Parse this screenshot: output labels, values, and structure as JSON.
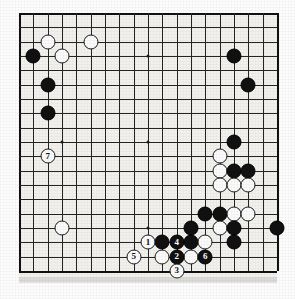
{
  "board": {
    "type": "go-board",
    "size": 19,
    "origin_x": 19,
    "origin_y": 13,
    "spacing": 14.33,
    "star_points": [
      [
        3,
        3
      ],
      [
        9,
        3
      ],
      [
        15,
        3
      ],
      [
        3,
        9
      ],
      [
        9,
        9
      ],
      [
        15,
        9
      ],
      [
        3,
        15
      ],
      [
        9,
        15
      ],
      [
        15,
        15
      ]
    ],
    "background_color": "#f2f1ed",
    "line_color": "#242424",
    "black_color": "#111111",
    "white_color": "#fbfbfb"
  },
  "stones": [
    {
      "color": "white",
      "col": 2,
      "row": 2,
      "label": ""
    },
    {
      "color": "white",
      "col": 5,
      "row": 2,
      "label": ""
    },
    {
      "color": "white",
      "col": 3,
      "row": 3,
      "label": ""
    },
    {
      "color": "black",
      "col": 1,
      "row": 3,
      "label": ""
    },
    {
      "color": "black",
      "col": 15,
      "row": 3,
      "label": ""
    },
    {
      "color": "black",
      "col": 2,
      "row": 5,
      "label": ""
    },
    {
      "color": "black",
      "col": 16,
      "row": 5,
      "label": ""
    },
    {
      "color": "black",
      "col": 2,
      "row": 7,
      "label": ""
    },
    {
      "color": "black",
      "col": 15,
      "row": 9,
      "label": ""
    },
    {
      "color": "white",
      "col": 2,
      "row": 10,
      "label": "7"
    },
    {
      "color": "white",
      "col": 14,
      "row": 10,
      "label": ""
    },
    {
      "color": "white",
      "col": 14,
      "row": 11,
      "label": ""
    },
    {
      "color": "black",
      "col": 15,
      "row": 11,
      "label": ""
    },
    {
      "color": "black",
      "col": 16,
      "row": 11,
      "label": ""
    },
    {
      "color": "white",
      "col": 14,
      "row": 12,
      "label": ""
    },
    {
      "color": "white",
      "col": 15,
      "row": 12,
      "label": ""
    },
    {
      "color": "white",
      "col": 16,
      "row": 12,
      "label": ""
    },
    {
      "color": "black",
      "col": 13,
      "row": 14,
      "label": ""
    },
    {
      "color": "black",
      "col": 14,
      "row": 14,
      "label": ""
    },
    {
      "color": "white",
      "col": 15,
      "row": 14,
      "label": ""
    },
    {
      "color": "white",
      "col": 16,
      "row": 14,
      "label": ""
    },
    {
      "color": "white",
      "col": 3,
      "row": 15,
      "label": ""
    },
    {
      "color": "black",
      "col": 12,
      "row": 15,
      "label": ""
    },
    {
      "color": "white",
      "col": 14,
      "row": 15,
      "label": ""
    },
    {
      "color": "black",
      "col": 15,
      "row": 15,
      "label": ""
    },
    {
      "color": "black",
      "col": 18,
      "row": 15,
      "label": ""
    },
    {
      "color": "white",
      "col": 9,
      "row": 16,
      "label": "1"
    },
    {
      "color": "black",
      "col": 10,
      "row": 16,
      "label": ""
    },
    {
      "color": "black",
      "col": 11,
      "row": 16,
      "label": "4"
    },
    {
      "color": "black",
      "col": 12,
      "row": 16,
      "label": ""
    },
    {
      "color": "white",
      "col": 13,
      "row": 16,
      "label": ""
    },
    {
      "color": "black",
      "col": 15,
      "row": 16,
      "label": ""
    },
    {
      "color": "white",
      "col": 8,
      "row": 17,
      "label": "5"
    },
    {
      "color": "white",
      "col": 10,
      "row": 17,
      "label": ""
    },
    {
      "color": "black",
      "col": 11,
      "row": 17,
      "label": "2"
    },
    {
      "color": "white",
      "col": 12,
      "row": 17,
      "label": ""
    },
    {
      "color": "black",
      "col": 13,
      "row": 17,
      "label": "6"
    },
    {
      "color": "white",
      "col": 11,
      "row": 18,
      "label": "3"
    }
  ],
  "move_numbers": {
    "1": "1",
    "2": "2",
    "3": "3",
    "4": "4",
    "5": "5",
    "6": "6",
    "7": "7"
  }
}
